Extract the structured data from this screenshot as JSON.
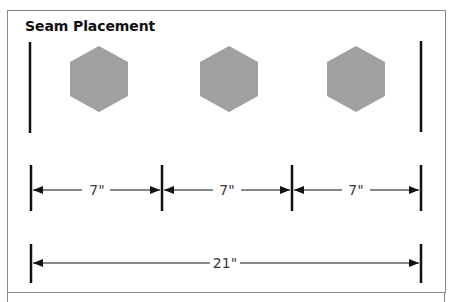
{
  "title": "Seam Placement",
  "colors": {
    "hexagon_fill": "#a0a0a0",
    "line": "#111111",
    "frame": "#8a8a8a",
    "label": "#3a3a3a"
  },
  "hexagons": [
    {
      "cx": 99,
      "cy": 79
    },
    {
      "cx": 229,
      "cy": 79
    },
    {
      "cx": 356,
      "cy": 79
    }
  ],
  "seam_lines": {
    "left_x": 30,
    "right_x": 421
  },
  "measurements": {
    "segments": [
      {
        "label": "7\"",
        "from_x": 31,
        "to_x": 162
      },
      {
        "label": "7\"",
        "from_x": 162,
        "to_x": 292
      },
      {
        "label": "7\"",
        "from_x": 292,
        "to_x": 421
      }
    ],
    "total": {
      "label": "21\"",
      "from_x": 31,
      "to_x": 421
    }
  }
}
